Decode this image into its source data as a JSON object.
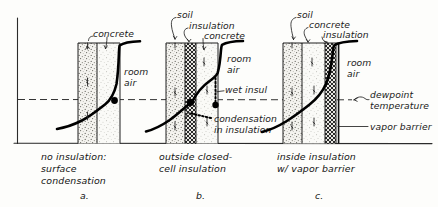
{
  "figure": {
    "baseline_label": "grade / floor line"
  },
  "global_annotations": {
    "dewpoint_line_label_1": "dewpoint",
    "dewpoint_line_label_2": "temperature"
  },
  "panels": [
    {
      "id": "a",
      "letter": "a.",
      "caption_lines": [
        "no insulation:",
        "surface",
        "condensation"
      ],
      "callouts": [
        {
          "name": "concrete",
          "text": "concrete"
        }
      ],
      "room_air_label_1": "room",
      "room_air_label_2": "air",
      "layers": [
        {
          "name": "soil",
          "pattern": "stipple-dense"
        },
        {
          "name": "concrete",
          "pattern": "stipple-light"
        }
      ],
      "condensation_point": "at inner concrete surface"
    },
    {
      "id": "b",
      "letter": "b.",
      "caption_lines": [
        "outside closed-",
        "cell insulation"
      ],
      "callouts": [
        {
          "name": "soil",
          "text": "soil"
        },
        {
          "name": "insulation",
          "text": "insulation"
        },
        {
          "name": "concrete",
          "text": "concrete"
        }
      ],
      "room_air_label_1": "room",
      "room_air_label_2": "air",
      "wet_insul_label": "wet insul",
      "condensation_label_1": "condensation",
      "condensation_label_2": "in insulation",
      "layers": [
        {
          "name": "soil",
          "pattern": "stipple-dense"
        },
        {
          "name": "insulation",
          "pattern": "crosshatch"
        },
        {
          "name": "concrete",
          "pattern": "stipple-light"
        }
      ],
      "condensation_point": "within outboard insulation"
    },
    {
      "id": "c",
      "letter": "c.",
      "caption_lines": [
        "inside insulation",
        "w/ vapor barrier"
      ],
      "callouts": [
        {
          "name": "soil",
          "text": "soil"
        },
        {
          "name": "concrete",
          "text": "concrete"
        },
        {
          "name": "insulation",
          "text": "insulation"
        }
      ],
      "room_air_label_1": "room",
      "room_air_label_2": "air",
      "vapor_barrier_label": "vapor barrier",
      "layers": [
        {
          "name": "soil",
          "pattern": "stipple-dense"
        },
        {
          "name": "concrete",
          "pattern": "stipple-light"
        },
        {
          "name": "insulation",
          "pattern": "crosshatch"
        },
        {
          "name": "vapor-barrier",
          "pattern": "solid-line"
        }
      ],
      "condensation_point": "none - barrier blocks vapor"
    }
  ],
  "colors": {
    "ink": "#1a1a1a",
    "paper": "#fdfdfb",
    "curve": "#000000",
    "dash": "#333333"
  }
}
